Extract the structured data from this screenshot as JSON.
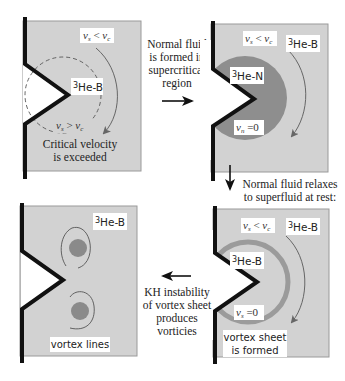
{
  "colors": {
    "panel_fill": "#d2d2d2",
    "panel_border": "#9a9a9a",
    "wall": "#111111",
    "normal_fluid": "#8e8e8e",
    "vortex_sheet": "#9b9b9b",
    "vortex_core": "#8a8a8a",
    "arrow_gray": "#666666",
    "label_bg": "#ffffff"
  },
  "panels": {
    "top_left": {
      "vs_lt_vc": {
        "lhs": "v",
        "lhs_sub": "s",
        "op": " < ",
        "rhs": "v",
        "rhs_sub": "c"
      },
      "phase_label": {
        "sup": "3",
        "text": "He-B"
      },
      "vs_gt_vc": {
        "lhs": "v",
        "lhs_sub": "s",
        "op": " > ",
        "rhs": "v",
        "rhs_sub": "c"
      },
      "caption_line1": "Critical velocity",
      "caption_line2": "is exceeded"
    },
    "top_right": {
      "vs_lt_vc": {
        "lhs": "v",
        "lhs_sub": "s",
        "op": " < ",
        "rhs": "v",
        "rhs_sub": "c"
      },
      "phase_label": {
        "sup": "3",
        "text": "He-B"
      },
      "normal_label": {
        "sup": "3",
        "text": "He-N"
      },
      "vn_zero": {
        "lhs": "v",
        "lhs_sub": "n",
        "op": " =0"
      }
    },
    "bottom_right": {
      "vs_lt_vc": {
        "lhs": "v",
        "lhs_sub": "s",
        "op": " < ",
        "rhs": "v",
        "rhs_sub": "c"
      },
      "phase_label": {
        "sup": "3",
        "text": "He-B"
      },
      "inner_label": {
        "sup": "3",
        "text": "He-B"
      },
      "vs_zero": {
        "lhs": "v",
        "lhs_sub": "s",
        "op": " =0"
      },
      "caption_line1": "vortex sheet",
      "caption_line2": "is formed"
    },
    "bottom_left": {
      "phase_label": {
        "sup": "3",
        "text": "He-B"
      },
      "caption": "vortex lines"
    }
  },
  "transitions": {
    "step1": {
      "lines": [
        "Normal fluid",
        "is formed in",
        "supercritical",
        "region"
      ],
      "direction": "right"
    },
    "step2": {
      "lines": [
        "Normal fluid relaxes",
        "to superfluid at rest:"
      ],
      "direction": "down"
    },
    "step3": {
      "lines": [
        "KH instability",
        "of vortex sheet",
        "produces",
        "vorticies"
      ],
      "direction": "left"
    }
  }
}
